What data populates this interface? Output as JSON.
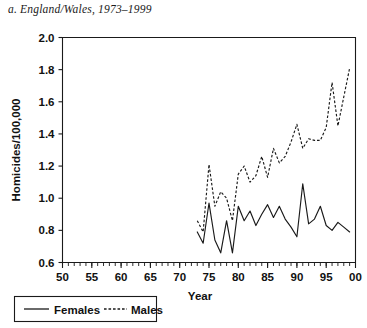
{
  "panel": {
    "title": "a. England/Wales, 1973–1999"
  },
  "legend": {
    "females_label": "Females",
    "males_label": "Males"
  },
  "chart_data": {
    "type": "line",
    "title": "a. England/Wales, 1973–1999",
    "xlabel": "Year",
    "ylabel": "Homicides/100,000",
    "xlim": [
      50,
      100
    ],
    "ylim": [
      0.6,
      2.0
    ],
    "ytick_values": [
      0.6,
      0.8,
      1.0,
      1.2,
      1.4,
      1.6,
      1.8,
      2.0
    ],
    "ytick_labels": [
      "0.6",
      "0.8",
      "1.0",
      "1.2",
      "1.4",
      "1.6",
      "1.8",
      "2.0"
    ],
    "xtick_values": [
      50,
      55,
      60,
      65,
      70,
      75,
      80,
      85,
      90,
      95,
      100
    ],
    "xtick_labels": [
      "50",
      "55",
      "60",
      "65",
      "70",
      "75",
      "80",
      "85",
      "90",
      "95",
      "00"
    ],
    "xminor_step": 1,
    "grid": false,
    "legend_position": "below-left",
    "x": [
      73,
      74,
      75,
      76,
      77,
      78,
      79,
      80,
      81,
      82,
      83,
      84,
      85,
      86,
      87,
      88,
      89,
      90,
      91,
      92,
      93,
      94,
      95,
      96,
      97,
      98,
      99
    ],
    "series": [
      {
        "name": "Females",
        "style": "solid",
        "color": "#1a1a1a",
        "values": [
          0.79,
          0.72,
          0.97,
          0.74,
          0.66,
          0.86,
          0.66,
          0.95,
          0.86,
          0.92,
          0.83,
          0.9,
          0.96,
          0.88,
          0.95,
          0.87,
          0.82,
          0.76,
          1.09,
          0.84,
          0.87,
          0.95,
          0.83,
          0.8,
          0.85,
          0.82,
          0.79
        ]
      },
      {
        "name": "Males",
        "style": "dashed",
        "color": "#1a1a1a",
        "values": [
          0.86,
          0.79,
          1.21,
          0.95,
          1.04,
          1.0,
          0.86,
          1.15,
          1.2,
          1.1,
          1.14,
          1.26,
          1.13,
          1.31,
          1.22,
          1.26,
          1.35,
          1.46,
          1.31,
          1.37,
          1.36,
          1.36,
          1.44,
          1.72,
          1.45,
          1.63,
          1.81
        ]
      }
    ]
  }
}
